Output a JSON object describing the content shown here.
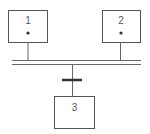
{
  "diagram": {
    "type": "grafcet",
    "steps": [
      {
        "id": "step-1",
        "label": "1",
        "active_token": true
      },
      {
        "id": "step-2",
        "label": "2",
        "active_token": true
      },
      {
        "id": "step-3",
        "label": "3",
        "active_token": false
      }
    ],
    "synchronization": "double-line",
    "transitions": [
      {
        "id": "transition-1",
        "from": [
          "1",
          "2"
        ],
        "to": [
          "3"
        ]
      }
    ],
    "colors": {
      "stroke": "#555555",
      "bar": "#333333",
      "background": "#ffffff"
    }
  }
}
